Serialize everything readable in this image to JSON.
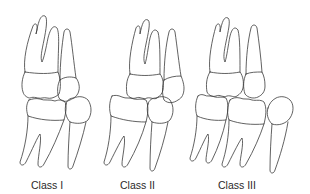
{
  "diagram": {
    "topic": "Angle classification of molar occlusion",
    "panels": [
      {
        "id": "class-1",
        "label": "Class I"
      },
      {
        "id": "class-2",
        "label": "Class II"
      },
      {
        "id": "class-3",
        "label": "Class III"
      }
    ]
  },
  "colors": {
    "line": "#3a3a3a",
    "text": "#2a2a2a",
    "background": "#ffffff"
  }
}
